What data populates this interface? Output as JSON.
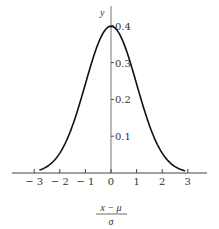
{
  "chart_data": {
    "type": "line",
    "title": "",
    "xlabel": {
      "numerator": "x − μ",
      "denominator": "σ"
    },
    "ylabel": "y",
    "xlim": [
      -3.5,
      3.5
    ],
    "ylim": [
      0,
      0.42
    ],
    "grid": false,
    "legend": null,
    "x_ticks": [
      -3,
      -2,
      -1,
      0,
      1,
      2,
      3
    ],
    "x_tick_labels": [
      "− 3",
      "− 2",
      "− 1",
      "0",
      "1",
      "2",
      "3"
    ],
    "y_ticks": [
      0.1,
      0.2,
      0.3,
      0.4
    ],
    "y_tick_labels": [
      "0.1",
      "0.2",
      "0.3",
      "0.4"
    ],
    "series": [
      {
        "name": "standard normal density",
        "x": [
          -2.8,
          -2.5,
          -2.0,
          -1.5,
          -1.0,
          -0.5,
          0,
          0.5,
          1.0,
          1.5,
          2.0,
          2.5,
          2.9
        ],
        "values": [
          0.008,
          0.018,
          0.054,
          0.13,
          0.242,
          0.352,
          0.399,
          0.352,
          0.242,
          0.13,
          0.054,
          0.018,
          0.006
        ]
      }
    ]
  }
}
